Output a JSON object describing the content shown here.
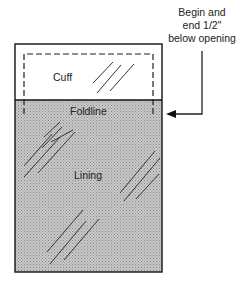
{
  "diagram": {
    "labels": {
      "cuff": "Cuff",
      "foldline": "Foldline",
      "lining": "Lining"
    },
    "annotation": {
      "line1": "Begin and",
      "line2": "end 1/2\"",
      "line3": "below opening"
    },
    "colors": {
      "lining_fill": "#b9b9b9",
      "cuff_fill": "#ffffff",
      "stroke": "#222222"
    }
  }
}
